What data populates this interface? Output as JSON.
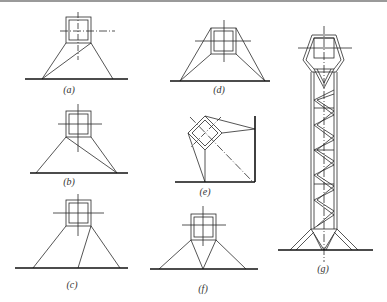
{
  "figure": {
    "panels": [
      {
        "id": "a",
        "label": "(a)",
        "label_pos": [
          69,
          84
        ]
      },
      {
        "id": "b",
        "label": "(b)",
        "label_pos": [
          69,
          176
        ]
      },
      {
        "id": "c",
        "label": "(c)",
        "label_pos": [
          72,
          279
        ]
      },
      {
        "id": "d",
        "label": "(d)",
        "label_pos": [
          219,
          84
        ]
      },
      {
        "id": "e",
        "label": "(e)",
        "label_pos": [
          205,
          186
        ]
      },
      {
        "id": "f",
        "label": "(f)",
        "label_pos": [
          203,
          283
        ]
      },
      {
        "id": "g",
        "label": "(g)",
        "label_pos": [
          323,
          263
        ]
      }
    ],
    "colors": {
      "line": "#2a2a2a",
      "ground": "#111111",
      "band": "#9a9a9a"
    }
  }
}
